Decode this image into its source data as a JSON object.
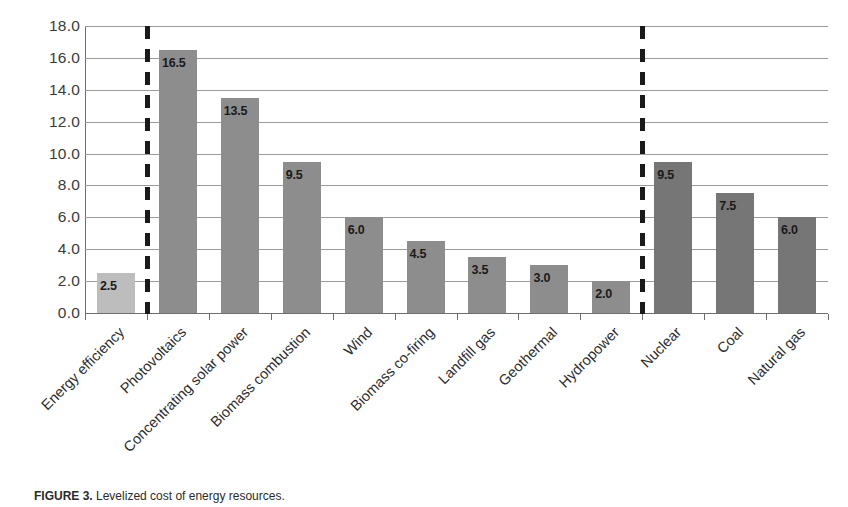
{
  "chart_data": {
    "type": "bar",
    "title": "",
    "xlabel": "",
    "ylabel": "",
    "ylim": [
      0,
      18
    ],
    "ytick_step": 2,
    "grid": true,
    "legend": "none",
    "y_tick_labels": [
      "18.0",
      "16.0",
      "14.0",
      "12.0",
      "10.0",
      "8.0",
      "6.0",
      "4.0",
      "2.0",
      "0.0"
    ],
    "categories": [
      "Energy efficiency",
      "Photovoltaics",
      "Concentrating solar power",
      "Biomass combustion",
      "Wind",
      "Biomass co-firing",
      "Landfill gas",
      "Geothermal",
      "Hydropower",
      "Nuclear",
      "Coal",
      "Natural gas"
    ],
    "values": [
      2.5,
      16.5,
      13.5,
      9.5,
      6.0,
      4.5,
      3.5,
      3.0,
      2.0,
      9.5,
      7.5,
      6.0
    ],
    "value_labels": [
      "2.5",
      "16.5",
      "13.5",
      "9.5",
      "6.0",
      "4.5",
      "3.5",
      "3.0",
      "2.0",
      "9.5",
      "7.5",
      "6.0"
    ],
    "bar_tones": [
      "light",
      "mid",
      "mid",
      "mid",
      "mid",
      "mid",
      "mid",
      "mid",
      "mid",
      "dark",
      "dark",
      "dark"
    ],
    "annotations": [
      {
        "name": "group-divider-left",
        "type": "dashed-vertical-line",
        "after_category": "Energy efficiency"
      },
      {
        "name": "group-divider-right",
        "type": "dashed-vertical-line",
        "after_category": "Hydropower"
      }
    ],
    "colors": {
      "bar_light": "#bdbdbd",
      "bar_mid": "#8d8d8d",
      "bar_dark": "#767676",
      "gridline": "#9b9b9b",
      "axis": "#6e6e6e",
      "text": "#2b2b2b",
      "divider": "#1a1a1a",
      "background": "#ffffff"
    }
  },
  "caption": {
    "prefix": "FIGURE 3.",
    "text": " Levelized cost of energy resources."
  }
}
